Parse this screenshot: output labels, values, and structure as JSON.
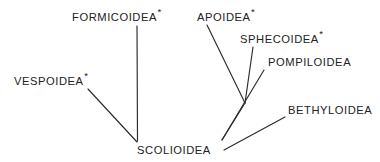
{
  "diagram": {
    "type": "cladogram",
    "background_color": "#ffffff",
    "line_color": "#2b2b2b",
    "text_color": "#222222",
    "asterisk_glyph": "*",
    "asterisk_meaning": "marked taxon",
    "root": {
      "label": "SCOLIOIDEA",
      "has_asterisk": false,
      "x": 137,
      "y": 153
    },
    "taxa": [
      {
        "id": "formicoidea",
        "label": "FORMICOIDEA",
        "has_asterisk": true,
        "label_x": 72,
        "label_y": 21,
        "asterisk_x": 158,
        "asterisk_y": 14,
        "branch": {
          "x1": 137,
          "y1": 26,
          "x2": 137.5,
          "y2": 141
        }
      },
      {
        "id": "apoidea",
        "label": "APOIDEA",
        "has_asterisk": true,
        "label_x": 197,
        "label_y": 21,
        "asterisk_x": 251,
        "asterisk_y": 14,
        "branch": {
          "x1": 207,
          "y1": 25,
          "x2": 245,
          "y2": 103
        }
      },
      {
        "id": "sphecoidea",
        "label": "SPHECOIDEA",
        "has_asterisk": true,
        "label_x": 240,
        "label_y": 43,
        "asterisk_x": 315,
        "asterisk_y": 36,
        "branch": {
          "x1": 253,
          "y1": 47,
          "x2": 245,
          "y2": 103
        }
      },
      {
        "id": "pompiloidea",
        "label": "POMPILOIDEA",
        "has_asterisk": false,
        "label_x": 268,
        "label_y": 66,
        "branch": {
          "x1": 264,
          "y1": 70,
          "x2": 222,
          "y2": 140
        }
      },
      {
        "id": "vespoidea",
        "label": "VESPOIDEA",
        "has_asterisk": true,
        "label_x": 14,
        "label_y": 85,
        "asterisk_x": 88,
        "asterisk_y": 78,
        "branch": {
          "x1": 88,
          "y1": 89,
          "x2": 137,
          "y2": 142
        }
      },
      {
        "id": "bethyloidea",
        "label": "BETHYLOIDEA",
        "has_asterisk": false,
        "label_x": 288,
        "label_y": 114,
        "branch": {
          "x1": 285,
          "y1": 117,
          "x2": 224,
          "y2": 150
        }
      },
      {
        "id": "scolioidea",
        "label": "SCOLIOIDEA",
        "has_asterisk": false,
        "label_x": 137,
        "label_y": 154,
        "branch": null
      }
    ],
    "internal_branches": [
      {
        "id": "apoid-sphecoid-stem",
        "x1": 245,
        "y1": 103,
        "x2": 222,
        "y2": 140
      }
    ],
    "nodes": [
      {
        "id": "node-apoidea-sphecoidea",
        "x": 245,
        "y": 103
      },
      {
        "id": "node-left-clade",
        "x": 137,
        "y": 141
      },
      {
        "id": "node-right-clade",
        "x": 222,
        "y": 140
      },
      {
        "id": "node-bethyloidea-base",
        "x": 224,
        "y": 150
      }
    ]
  }
}
